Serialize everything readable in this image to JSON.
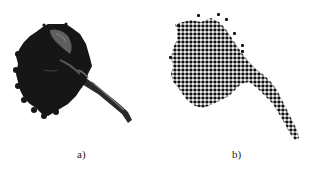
{
  "figure": {
    "panels": [
      {
        "id": "a",
        "label": "a)",
        "description": "grayscale photograph of a flower head with stem"
      },
      {
        "id": "b",
        "label": "b)",
        "description": "dot-matrix (binarized grid) rendering of the same flower"
      }
    ],
    "colors": {
      "ink": "#111111",
      "background": "#ffffff",
      "highlight": "#6a6a6a"
    }
  }
}
